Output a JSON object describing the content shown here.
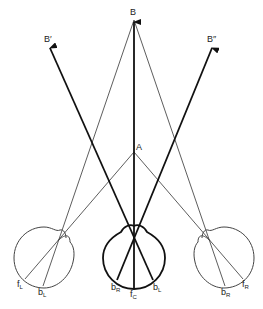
{
  "diagram": {
    "type": "geometric optics / visual direction diagram",
    "points": {
      "B": {
        "label": "B",
        "x": 134,
        "y": 20
      },
      "B_prime": {
        "label": "B′",
        "x": 50,
        "y": 46
      },
      "B_double_prime": {
        "label": "B″",
        "x": 212,
        "y": 46
      },
      "A": {
        "label": "A",
        "x": 134,
        "y": 152
      }
    },
    "heads": [
      {
        "name": "left-head",
        "cx": 45,
        "cy": 257,
        "r": 31
      },
      {
        "name": "center-head",
        "cx": 134,
        "cy": 257,
        "r": 31
      },
      {
        "name": "right-head",
        "cx": 222,
        "cy": 257,
        "r": 31
      }
    ],
    "labels": {
      "B": "B",
      "B_prime": "B′",
      "B_double_prime": "B″",
      "A": "A",
      "fL": {
        "main": "f",
        "sub": "L"
      },
      "bL_left": {
        "main": "b",
        "sub": "L"
      },
      "bR_center": {
        "main": "b",
        "sub": "R"
      },
      "fC": {
        "main": "f",
        "sub": "C"
      },
      "bL_center": {
        "main": "b",
        "sub": "L"
      },
      "bR_right": {
        "main": "b",
        "sub": "R"
      },
      "fR": {
        "main": "f",
        "sub": "R"
      }
    }
  }
}
